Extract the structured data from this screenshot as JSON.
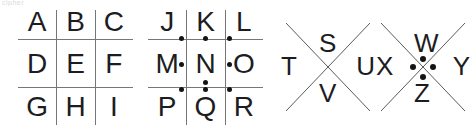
{
  "figure": {
    "artifact_text": "cipher",
    "line_color": "#767679",
    "glyph_color": "#1d1d1f",
    "dot_color": "#141416",
    "background": "#ffffff"
  },
  "blocks": [
    {
      "name": "grid-plain",
      "type": "tic-tac-toe-grid",
      "dotted": false,
      "rows": [
        [
          {
            "letter": "A",
            "dot": null
          },
          {
            "letter": "B",
            "dot": null
          },
          {
            "letter": "C",
            "dot": null
          }
        ],
        [
          {
            "letter": "D",
            "dot": null
          },
          {
            "letter": "E",
            "dot": null
          },
          {
            "letter": "F",
            "dot": null
          }
        ],
        [
          {
            "letter": "G",
            "dot": null
          },
          {
            "letter": "H",
            "dot": null
          },
          {
            "letter": "I",
            "dot": null
          }
        ]
      ]
    },
    {
      "name": "grid-dotted",
      "type": "tic-tac-toe-grid",
      "dotted": true,
      "rows": [
        [
          {
            "letter": "J",
            "dot": "bottom-right"
          },
          {
            "letter": "K",
            "dot": "bottom-center"
          },
          {
            "letter": "L",
            "dot": "bottom-left"
          }
        ],
        [
          {
            "letter": "M",
            "dot": "middle-right"
          },
          {
            "letter": "N",
            "dot": "bottom-center"
          },
          {
            "letter": "O",
            "dot": "middle-left"
          }
        ],
        [
          {
            "letter": "P",
            "dot": "top-right"
          },
          {
            "letter": "Q",
            "dot": "top-center"
          },
          {
            "letter": "R",
            "dot": "top-left"
          }
        ]
      ]
    },
    {
      "name": "x-plain",
      "type": "x-shape",
      "dotted": false,
      "letters": {
        "top": "S",
        "left": "T",
        "right": "U",
        "bottom": "V"
      }
    },
    {
      "name": "x-dotted",
      "type": "x-shape",
      "dotted": true,
      "letters": {
        "top": "W",
        "left": "X",
        "right": "Y",
        "bottom": "Z"
      }
    }
  ]
}
